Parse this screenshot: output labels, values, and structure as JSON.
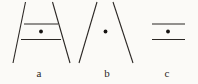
{
  "figure": {
    "canvas": {
      "width": 198,
      "height": 84
    },
    "background_color": "#fbfaf7",
    "stroke_color": "#2b2724",
    "dot_color": "#171412",
    "stroke_width": 1.1,
    "panels": [
      {
        "id": "a",
        "label": "a",
        "label_x": 39,
        "label_y": 77,
        "description": "two converging slanted lines with two horizontal lines and a center dot",
        "slanted_lines": [
          {
            "name": "left-slant",
            "x1": 25.5,
            "y1": 2,
            "x2": 13,
            "y2": 63
          },
          {
            "name": "right-slant",
            "x1": 52.5,
            "y1": 2,
            "x2": 70,
            "y2": 63
          }
        ],
        "horizontal_lines": [
          {
            "name": "upper-rule",
            "x1": 24,
            "y1": 24,
            "x2": 58,
            "y2": 24
          },
          {
            "name": "lower-rule",
            "x1": 21,
            "y1": 39.5,
            "x2": 61,
            "y2": 39.5
          }
        ],
        "dots": [
          {
            "name": "center-dot",
            "cx": 41,
            "cy": 31.5,
            "r": 1.9
          }
        ]
      },
      {
        "id": "b",
        "label": "b",
        "label_x": 107,
        "label_y": 77,
        "description": "two converging slanted lines with a center dot only",
        "slanted_lines": [
          {
            "name": "left-slant",
            "x1": 97,
            "y1": 2,
            "x2": 79,
            "y2": 63
          },
          {
            "name": "right-slant",
            "x1": 113,
            "y1": 2,
            "x2": 133,
            "y2": 63
          }
        ],
        "horizontal_lines": [],
        "dots": [
          {
            "name": "center-dot",
            "cx": 105.5,
            "cy": 31.5,
            "r": 1.9
          }
        ]
      },
      {
        "id": "c",
        "label": "c",
        "label_x": 167,
        "label_y": 77,
        "description": "two horizontal parallel lines with a center dot only",
        "slanted_lines": [],
        "horizontal_lines": [
          {
            "name": "upper-rule",
            "x1": 152,
            "y1": 24,
            "x2": 185,
            "y2": 24
          },
          {
            "name": "lower-rule",
            "x1": 152,
            "y1": 39.5,
            "x2": 185,
            "y2": 39.5
          }
        ],
        "dots": [
          {
            "name": "center-dot",
            "cx": 168,
            "cy": 31.5,
            "r": 1.9
          }
        ]
      }
    ]
  }
}
